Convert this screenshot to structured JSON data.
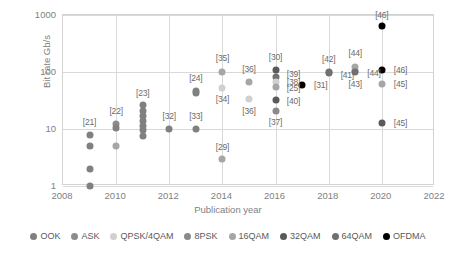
{
  "chart_data": {
    "type": "scatter",
    "title": "",
    "xlabel": "Publication year",
    "ylabel": "Bit rate Gb/s",
    "xlim": [
      2008,
      2022
    ],
    "ylim": [
      1,
      1000
    ],
    "yscale": "log",
    "xticks": [
      "2008",
      "2010",
      "2012",
      "2014",
      "2016",
      "2018",
      "2020",
      "2022"
    ],
    "yticks": [
      "1",
      "10",
      "100",
      "1000"
    ],
    "grid": true,
    "legend_position": "bottom",
    "legend": [
      {
        "name": "OOK",
        "color": "#808080"
      },
      {
        "name": "ASK",
        "color": "#8c8c8c"
      },
      {
        "name": "QPSK/4QAM",
        "color": "#d0d0d0"
      },
      {
        "name": "8PSK",
        "color": "#8a8a8a"
      },
      {
        "name": "16QAM",
        "color": "#a6a6a6"
      },
      {
        "name": "32QAM",
        "color": "#5a5a5a"
      },
      {
        "name": "64QAM",
        "color": "#707070"
      },
      {
        "name": "OFDMA",
        "color": "#000000"
      }
    ],
    "points": [
      {
        "x": 2009,
        "y": 8,
        "series": "OOK",
        "color": "#808080",
        "label": "[21]",
        "lx": 2009,
        "ly": 13.5,
        "lanchor": "above"
      },
      {
        "x": 2009,
        "y": 5,
        "series": "OOK",
        "color": "#808080",
        "label": "",
        "lx": 0,
        "ly": 0,
        "lanchor": ""
      },
      {
        "x": 2009,
        "y": 2,
        "series": "OOK",
        "color": "#808080",
        "label": "",
        "lx": 0,
        "ly": 0,
        "lanchor": ""
      },
      {
        "x": 2009,
        "y": 1,
        "series": "OOK",
        "color": "#808080",
        "label": "",
        "lx": 0,
        "ly": 0,
        "lanchor": ""
      },
      {
        "x": 2010,
        "y": 12,
        "series": "ASK",
        "color": "#8c8c8c",
        "label": "[22]",
        "lx": 2010,
        "ly": 20.5,
        "lanchor": "above"
      },
      {
        "x": 2010,
        "y": 10.5,
        "series": "OOK",
        "color": "#808080",
        "label": "",
        "lx": 0,
        "ly": 0,
        "lanchor": ""
      },
      {
        "x": 2010,
        "y": 5,
        "series": "16QAM",
        "color": "#a6a6a6",
        "label": "",
        "lx": 0,
        "ly": 0,
        "lanchor": ""
      },
      {
        "x": 2011,
        "y": 26,
        "series": "OOK",
        "color": "#808080",
        "label": "[23]",
        "lx": 2011,
        "ly": 43,
        "lanchor": "above"
      },
      {
        "x": 2011,
        "y": 21,
        "series": "OOK",
        "color": "#808080",
        "label": "",
        "lx": 0,
        "ly": 0,
        "lanchor": ""
      },
      {
        "x": 2011,
        "y": 17,
        "series": "OOK",
        "color": "#808080",
        "label": "",
        "lx": 0,
        "ly": 0,
        "lanchor": ""
      },
      {
        "x": 2011,
        "y": 14,
        "series": "OOK",
        "color": "#808080",
        "label": "",
        "lx": 0,
        "ly": 0,
        "lanchor": ""
      },
      {
        "x": 2011,
        "y": 11.5,
        "series": "OOK",
        "color": "#808080",
        "label": "",
        "lx": 0,
        "ly": 0,
        "lanchor": ""
      },
      {
        "x": 2011,
        "y": 9.5,
        "series": "OOK",
        "color": "#808080",
        "label": "",
        "lx": 0,
        "ly": 0,
        "lanchor": ""
      },
      {
        "x": 2011,
        "y": 7.5,
        "series": "OOK",
        "color": "#808080",
        "label": "",
        "lx": 0,
        "ly": 0,
        "lanchor": ""
      },
      {
        "x": 2012,
        "y": 10,
        "series": "OOK",
        "color": "#808080",
        "label": "[32]",
        "lx": 2012,
        "ly": 17,
        "lanchor": "above"
      },
      {
        "x": 2013,
        "y": 47,
        "series": "OOK",
        "color": "#808080",
        "label": "[24]",
        "lx": 2013,
        "ly": 80,
        "lanchor": "above"
      },
      {
        "x": 2013,
        "y": 42,
        "series": "OOK",
        "color": "#808080",
        "label": "",
        "lx": 0,
        "ly": 0,
        "lanchor": ""
      },
      {
        "x": 2013,
        "y": 10,
        "series": "OOK",
        "color": "#808080",
        "label": "[33]",
        "lx": 2013,
        "ly": 17,
        "lanchor": "above"
      },
      {
        "x": 2014,
        "y": 100,
        "series": "16QAM",
        "color": "#a6a6a6",
        "label": "[35]",
        "lx": 2014,
        "ly": 175,
        "lanchor": "above"
      },
      {
        "x": 2014,
        "y": 52,
        "series": "QPSK/4QAM",
        "color": "#d0d0d0",
        "label": "[34]",
        "lx": 2014,
        "ly": 33,
        "lanchor": "below"
      },
      {
        "x": 2014,
        "y": 3,
        "series": "16QAM",
        "color": "#a6a6a6",
        "label": "[29]",
        "lx": 2014,
        "ly": 4.9,
        "lanchor": "above"
      },
      {
        "x": 2015,
        "y": 68,
        "series": "16QAM",
        "color": "#a6a6a6",
        "label": "[36]",
        "lx": 2015,
        "ly": 112,
        "lanchor": "above"
      },
      {
        "x": 2015,
        "y": 33,
        "series": "QPSK/4QAM",
        "color": "#d0d0d0",
        "label": "[36]",
        "lx": 2015,
        "ly": 21,
        "lanchor": "below"
      },
      {
        "x": 2016,
        "y": 108,
        "series": "32QAM",
        "color": "#5a5a5a",
        "label": "[30]",
        "lx": 2016,
        "ly": 186,
        "lanchor": "above"
      },
      {
        "x": 2016,
        "y": 82,
        "series": "64QAM",
        "color": "#707070",
        "label": "[39]",
        "lx": 2016.42,
        "ly": 93,
        "lanchor": "right"
      },
      {
        "x": 2016,
        "y": 66,
        "series": "QPSK/4QAM",
        "color": "#d0d0d0",
        "label": "[38]",
        "lx": 2016.42,
        "ly": 68,
        "lanchor": "right"
      },
      {
        "x": 2016,
        "y": 54,
        "series": "16QAM",
        "color": "#a6a6a6",
        "label": "[25]",
        "lx": 2016.42,
        "ly": 52,
        "lanchor": "right"
      },
      {
        "x": 2016,
        "y": 32,
        "series": "32QAM",
        "color": "#5a5a5a",
        "label": "[40]",
        "lx": 2016.42,
        "ly": 31,
        "lanchor": "right"
      },
      {
        "x": 2016,
        "y": 21,
        "series": "8PSK",
        "color": "#8a8a8a",
        "label": "[37]",
        "lx": 2016,
        "ly": 13.5,
        "lanchor": "below"
      },
      {
        "x": 2017,
        "y": 60,
        "series": "OFDMA",
        "color": "#000000",
        "label": "[31]",
        "lx": 2017.45,
        "ly": 60,
        "lanchor": "right"
      },
      {
        "x": 2018,
        "y": 100,
        "series": "64QAM",
        "color": "#707070",
        "label": "[42]",
        "lx": 2018,
        "ly": 168,
        "lanchor": "above"
      },
      {
        "x": 2018,
        "y": 98,
        "series": "64QAM",
        "color": "#707070",
        "label": "[41]",
        "lx": 2018.45,
        "ly": 90,
        "lanchor": "right"
      },
      {
        "x": 2019,
        "y": 122,
        "series": "16QAM",
        "color": "#a6a6a6",
        "label": "[44]",
        "lx": 2019,
        "ly": 215,
        "lanchor": "above"
      },
      {
        "x": 2019,
        "y": 104,
        "series": "16QAM",
        "color": "#a6a6a6",
        "label": "[44]",
        "lx": 2019.45,
        "ly": 97,
        "lanchor": "right"
      },
      {
        "x": 2019,
        "y": 100,
        "series": "64QAM",
        "color": "#707070",
        "label": "[43]",
        "lx": 2019,
        "ly": 62,
        "lanchor": "below"
      },
      {
        "x": 2020,
        "y": 640,
        "series": "OFDMA",
        "color": "#000000",
        "label": "[46]",
        "lx": 2020,
        "ly": 1000,
        "lanchor": "above"
      },
      {
        "x": 2020,
        "y": 108,
        "series": "OFDMA",
        "color": "#000000",
        "label": "[46]",
        "lx": 2020.45,
        "ly": 108,
        "lanchor": "right"
      },
      {
        "x": 2020,
        "y": 62,
        "series": "16QAM",
        "color": "#a6a6a6",
        "label": "[45]",
        "lx": 2020.45,
        "ly": 62,
        "lanchor": "right"
      },
      {
        "x": 2020,
        "y": 12.5,
        "series": "32QAM",
        "color": "#5a5a5a",
        "label": "[45]",
        "lx": 2020.45,
        "ly": 12.5,
        "lanchor": "right"
      }
    ]
  }
}
